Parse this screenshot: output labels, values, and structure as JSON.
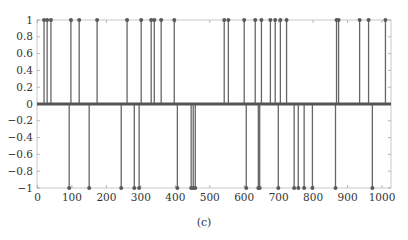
{
  "caption": "(c)",
  "chart_data": {
    "type": "stem",
    "title": "",
    "xlabel": "",
    "ylabel": "",
    "xlim": [
      0,
      1024
    ],
    "ylim": [
      -1,
      1
    ],
    "grid": false,
    "legend": null,
    "x_ticks": [
      0,
      100,
      200,
      300,
      400,
      500,
      600,
      700,
      800,
      900,
      1000
    ],
    "x_tick_labels": [
      "0",
      "100",
      "200",
      "300",
      "400",
      "500",
      "600",
      "700",
      "800",
      "900",
      "1000"
    ],
    "y_ticks": [
      1,
      0.8,
      0.6,
      0.4,
      0.2,
      0,
      -0.2,
      -0.4,
      -0.6,
      -0.8,
      -1
    ],
    "y_tick_labels": [
      "1",
      "0.8",
      "0.6",
      "0.4",
      "0.2",
      "0",
      "−0.2",
      "−0.4",
      "−0.6",
      "−0.8",
      "−1"
    ],
    "positive_spikes_x": [
      19,
      28,
      39,
      97,
      121,
      173,
      260,
      301,
      330,
      339,
      359,
      397,
      542,
      554,
      600,
      632,
      650,
      676,
      690,
      705,
      723,
      868,
      874,
      935,
      961,
      1010
    ],
    "negative_spikes_x": [
      92,
      150,
      243,
      281,
      295,
      406,
      446,
      452,
      458,
      606,
      641,
      645,
      699,
      745,
      757,
      774,
      798,
      865,
      972
    ],
    "baseline_value": 0,
    "colors": {
      "stem": "#666666",
      "marker": "#5a5a5a",
      "baseline": "#555555",
      "axis": "#aaaaaa"
    }
  }
}
